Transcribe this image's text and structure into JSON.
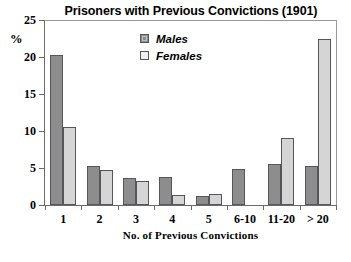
{
  "chart_data": {
    "type": "bar",
    "title": "Prisoners with Previous Convictions (1901)",
    "xlabel": "No. of Previous Convictions",
    "ylabel": "%",
    "categories": [
      "1",
      "2",
      "3",
      "4",
      "5",
      "6-10",
      "11-20",
      "> 20"
    ],
    "series": [
      {
        "name": "Males",
        "color": "#8d8d8d",
        "values": [
          20.3,
          5.3,
          3.6,
          3.8,
          1.2,
          4.9,
          5.5,
          5.3
        ]
      },
      {
        "name": "Females",
        "color": "#d5d5d5",
        "values": [
          10.5,
          4.7,
          3.2,
          1.4,
          1.5,
          0,
          9.0,
          22.5
        ]
      }
    ],
    "ylim": [
      0,
      25
    ],
    "yticks": [
      0,
      5,
      10,
      15,
      20,
      25
    ],
    "ytick_labels": [
      "0",
      "5",
      "10",
      "15",
      "20",
      "25"
    ],
    "grid": false,
    "legend_position": "inside-top-center"
  }
}
